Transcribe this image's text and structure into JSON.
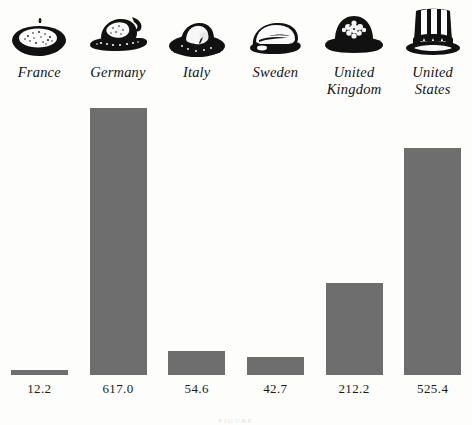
{
  "chart_data": {
    "type": "bar",
    "title": "",
    "xlabel": "",
    "ylabel": "",
    "categories": [
      "France",
      "Germany",
      "Italy",
      "Sweden",
      "United Kingdom",
      "United States"
    ],
    "values": [
      12.2,
      617.0,
      54.6,
      42.7,
      212.2,
      525.4
    ],
    "value_labels": [
      "12.2",
      "617.0",
      "54.6",
      "42.7",
      "212.2",
      "525.4"
    ],
    "ylim": [
      0,
      617.0
    ],
    "grid": false,
    "legend": null,
    "bar_color": "#6e6e6e",
    "background_color": "#fdfdfc",
    "icons": [
      "beret-icon",
      "tyrolean-hat-icon",
      "fedora-icon",
      "flat-cap-icon",
      "bowler-hat-icon",
      "uncle-sam-top-hat-icon"
    ]
  },
  "caption": "FIGURE"
}
